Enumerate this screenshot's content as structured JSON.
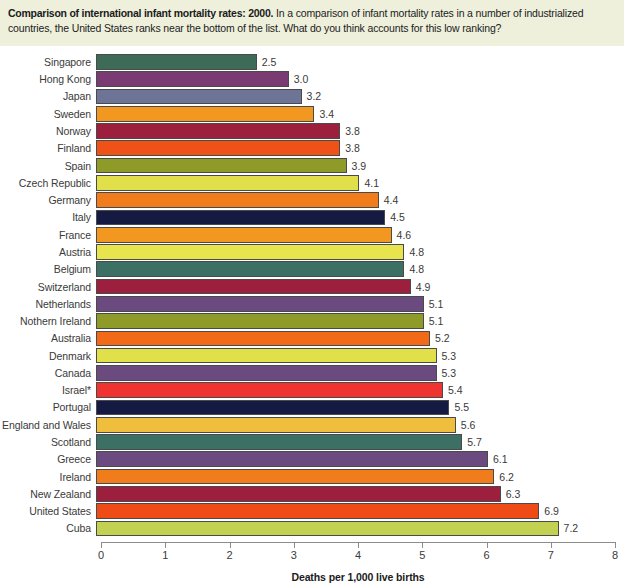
{
  "header": {
    "title": "Comparison of international infant mortality rates: 2000.",
    "body": " In a comparison of infant mortality rates in a number of industrialized countries, the United States ranks near the bottom of the list. What do you think accounts for this low ranking?"
  },
  "chart_data": {
    "type": "bar",
    "orientation": "horizontal",
    "title": "Comparison of international infant mortality rates: 2000",
    "xlabel": "Deaths per 1,000 live births",
    "ylabel": "",
    "xlim": [
      0,
      8
    ],
    "xticks": [
      "0",
      "1",
      "2",
      "3",
      "4",
      "5",
      "6",
      "7",
      "8"
    ],
    "grid": false,
    "legend": "none",
    "categories": [
      "Singapore",
      "Hong Kong",
      "Japan",
      "Sweden",
      "Norway",
      "Finland",
      "Spain",
      "Czech Republic",
      "Germany",
      "Italy",
      "France",
      "Austria",
      "Belgium",
      "Switzerland",
      "Netherlands",
      "Nothern Ireland",
      "Australia",
      "Denmark",
      "Canada",
      "Israel*",
      "Portugal",
      "England and Wales",
      "Scotland",
      "Greece",
      "Ireland",
      "New Zealand",
      "United States",
      "Cuba"
    ],
    "values": [
      2.5,
      3.0,
      3.2,
      3.4,
      3.8,
      3.8,
      3.9,
      4.1,
      4.4,
      4.5,
      4.6,
      4.8,
      4.8,
      4.9,
      5.1,
      5.1,
      5.2,
      5.3,
      5.3,
      5.4,
      5.5,
      5.6,
      5.7,
      6.1,
      6.2,
      6.3,
      6.9,
      7.2
    ],
    "value_labels": [
      "2.5",
      "3.0",
      "3.2",
      "3.4",
      "3.8",
      "3.8",
      "3.9",
      "4.1",
      "4.4",
      "4.5",
      "4.6",
      "4.8",
      "4.8",
      "4.9",
      "5.1",
      "5.1",
      "5.2",
      "5.3",
      "5.3",
      "5.4",
      "5.5",
      "5.6",
      "5.7",
      "6.1",
      "6.2",
      "6.3",
      "6.9",
      "7.2"
    ],
    "colors": [
      "#3d6b58",
      "#7a3b73",
      "#6d7496",
      "#f2971f",
      "#9c1f3d",
      "#ef5217",
      "#8e9b28",
      "#e2e04a",
      "#f07c1b",
      "#141a42",
      "#f2971f",
      "#e8e44e",
      "#3d7065",
      "#9c1f3d",
      "#6b4a80",
      "#8e9b28",
      "#f26a17",
      "#e2e04a",
      "#6b4a80",
      "#ee3330",
      "#141a42",
      "#efbe3c",
      "#3d7065",
      "#6b4a80",
      "#f07c1b",
      "#9c1f3d",
      "#ef4b17",
      "#c3d152"
    ],
    "bar_border_color": "#4a4a4a",
    "header_background": "#eef0dc"
  }
}
